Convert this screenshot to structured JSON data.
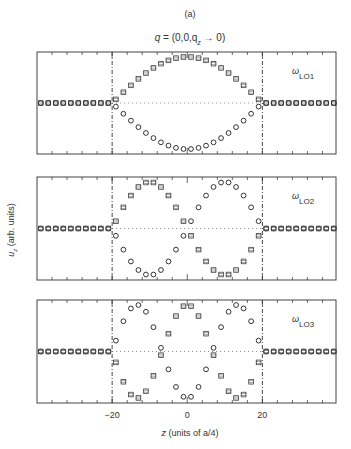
{
  "figure": {
    "panel_letter": "(a)",
    "title_q": "q",
    "title_rest": " = (0,0,q",
    "title_sub": "z",
    "title_end": " → 0)",
    "ylabel_main": "u",
    "ylabel_sub": "z",
    "ylabel_rest": " (arb. units)",
    "xlabel_main": "z",
    "xlabel_rest": " (units of a/4)"
  },
  "chart_data": {
    "type": "scatter",
    "xlabel": "z (units of a/4)",
    "ylabel": "u_z (arb. units)",
    "xlim": [
      -40,
      39.6
    ],
    "ylim": [
      -1.05,
      1.05
    ],
    "xticks": [
      -20,
      0,
      20
    ],
    "xtick_labels": [
      "-20",
      "0",
      "20"
    ],
    "minor_tick_step": 4,
    "interfaces": [
      -20,
      20
    ],
    "grid": false,
    "panels": [
      {
        "name": "LO1",
        "label_omega": "ω",
        "label_sub": "LO1",
        "series": [
          {
            "name": "squares",
            "marker": "square-cross",
            "mode": 1,
            "sign": 1
          },
          {
            "name": "circles",
            "marker": "circle",
            "mode": 1,
            "sign": -1
          }
        ]
      },
      {
        "name": "LO2",
        "label_omega": "ω",
        "label_sub": "LO2",
        "series": [
          {
            "name": "circles",
            "marker": "circle",
            "mode": 2,
            "sign": -1
          },
          {
            "name": "squares",
            "marker": "square-cross",
            "mode": 2,
            "sign": 1
          }
        ]
      },
      {
        "name": "LO3",
        "label_omega": "ω",
        "label_sub": "LO3",
        "series": [
          {
            "name": "circles",
            "marker": "circle",
            "mode": 3,
            "sign": 1
          },
          {
            "name": "squares",
            "marker": "square-cross",
            "mode": 3,
            "sign": -1
          }
        ]
      }
    ],
    "well_z_points": [
      -19,
      -17,
      -15,
      -13,
      -11,
      -9,
      -7,
      -5,
      -3,
      -1,
      1,
      3,
      5,
      7,
      9,
      11,
      13,
      15,
      17,
      19
    ],
    "barrier_z_points": [
      -39,
      -37,
      -35,
      -33,
      -31,
      -29,
      -27,
      -25,
      -23,
      -21,
      21,
      23,
      25,
      27,
      29,
      31,
      33,
      35,
      37,
      39
    ],
    "amplitude_note": "Inside well |z|<20: u_z = sign * A * cos/sin(mode*pi*z/40) standing wave; outside: u_z = 0",
    "amplitude": 0.95
  }
}
